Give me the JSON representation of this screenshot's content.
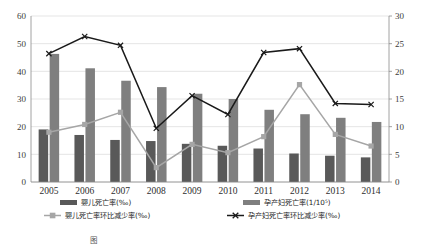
{
  "chart_data": {
    "type": "bar",
    "title": "",
    "subtitle": "",
    "xlabel": "",
    "ylabel": "",
    "categories": [
      "2005",
      "2006",
      "2007",
      "2008",
      "2009",
      "2010",
      "2011",
      "2012",
      "2013",
      "2014"
    ],
    "grid": true,
    "legend_position": "bottom",
    "axes": {
      "left": {
        "label": "",
        "min": 0,
        "max": 60,
        "ticks": [
          "0",
          "10",
          "20",
          "30",
          "40",
          "50",
          "60"
        ],
        "tick_values": [
          0,
          10,
          20,
          30,
          40,
          50,
          60
        ]
      },
      "right": {
        "label": "",
        "min": 0,
        "max": 30,
        "ticks": [
          "0",
          "5",
          "10",
          "15",
          "20",
          "25",
          "30"
        ],
        "tick_values": [
          0,
          5,
          10,
          15,
          20,
          25,
          30
        ]
      }
    },
    "series": [
      {
        "name": "婴儿死亡率(‰)",
        "type": "bar",
        "axis": "left",
        "color": "#595959",
        "values": [
          19.0,
          17.0,
          15.2,
          14.8,
          13.8,
          13.1,
          12.1,
          10.3,
          9.5,
          8.9
        ]
      },
      {
        "name": "孕产妇死亡率(1/10⁵)",
        "type": "bar",
        "axis": "left",
        "color": "#7f7f7f",
        "values": [
          46.3,
          41.1,
          36.6,
          34.3,
          31.9,
          30.0,
          26.1,
          24.5,
          23.2,
          21.7
        ]
      },
      {
        "name": "婴儿死亡率环比减少率(‰)",
        "type": "line",
        "axis": "right",
        "color": "#a6a6a6",
        "marker": "square",
        "values": [
          9.0,
          10.4,
          12.6,
          2.6,
          6.8,
          5.3,
          8.2,
          17.6,
          8.6,
          6.5
        ]
      },
      {
        "name": "孕产妇死亡率环比减少率(‰)",
        "type": "line",
        "axis": "right",
        "color": "#1a1a1a",
        "marker": "x",
        "values": [
          23.2,
          26.3,
          24.7,
          9.7,
          15.6,
          12.2,
          23.4,
          24.1,
          14.2,
          14.0
        ]
      }
    ]
  },
  "legend": {
    "items": [
      {
        "label": "婴儿死亡率(‰)",
        "swatch": "bar",
        "color": "#595959"
      },
      {
        "label": "孕产妇死亡率(1/10⁵)",
        "swatch": "bar",
        "color": "#7f7f7f"
      },
      {
        "label": "婴儿死亡率环比减少率(‰)",
        "swatch": "line-square",
        "color": "#a6a6a6"
      },
      {
        "label": "孕产妇死亡率环比减少率(‰)",
        "swatch": "line-x",
        "color": "#1a1a1a"
      }
    ]
  },
  "caption": {
    "text": "图"
  }
}
